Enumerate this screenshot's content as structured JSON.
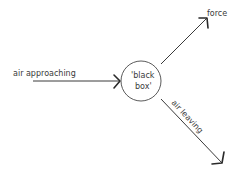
{
  "diagram": {
    "center": {
      "label_line1": "'black",
      "label_line2": "box'"
    },
    "inputs": [
      {
        "label": "air approaching"
      }
    ],
    "outputs": [
      {
        "label": "force"
      },
      {
        "label": "air leaving"
      }
    ],
    "colors": {
      "stroke": "#3a3a3a",
      "background": "#ffffff"
    }
  }
}
